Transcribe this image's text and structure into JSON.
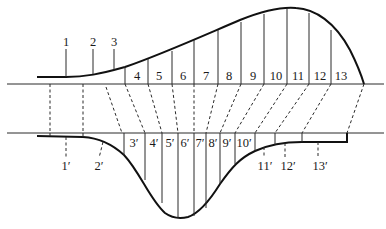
{
  "figure": {
    "upper": {
      "labels": [
        "1",
        "2",
        "3",
        "4",
        "5",
        "6",
        "7",
        "8",
        "9",
        "10",
        "11",
        "12",
        "13"
      ]
    },
    "lower": {
      "labels": [
        "1′",
        "2′",
        "3′",
        "4′",
        "5′",
        "6′",
        "7′",
        "8′",
        "9′",
        "10′",
        "11′",
        "12′",
        "13′"
      ]
    },
    "colors": {
      "line": "#111111",
      "background": "#ffffff"
    }
  }
}
